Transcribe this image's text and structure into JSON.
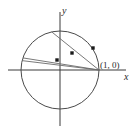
{
  "figure": {
    "background_color": "#ffffff",
    "width": 138,
    "height": 133
  },
  "labels": {
    "x_axis": "x",
    "y_axis": "y",
    "point_one_zero": "(1, 0)"
  },
  "chart_data": {
    "type": "scatter",
    "xlabel": "x",
    "ylabel": "y",
    "xlim": [
      -1.55,
      1.0
    ],
    "ylim": [
      -1.0,
      1.35
    ],
    "grid": false,
    "legend": null,
    "origin_px": [
      60,
      70
    ],
    "radius_px": 39,
    "colors": {
      "axis": "#3a3a3a",
      "circle": "#4a4a4a",
      "chord": "#6a6a6a",
      "dot": "#1a1a1a"
    },
    "circle": {
      "center": [
        0,
        0
      ],
      "radius": 1,
      "label": "unit circle"
    },
    "anchor_point": {
      "label": "(1, 0)",
      "x": 1,
      "y": 0
    },
    "chords": [
      {
        "name": "chord-1",
        "from": [
          1,
          0
        ],
        "to": [
          -0.97,
          0.24
        ],
        "midpoint": [
          0.015,
          0.12
        ]
      },
      {
        "name": "chord-2",
        "from": [
          1,
          0
        ],
        "to": [
          -0.95,
          0.31
        ],
        "midpoint": [
          0.025,
          0.155
        ]
      },
      {
        "name": "chord-3",
        "from": [
          1,
          0
        ],
        "to": [
          -0.21,
          0.975
        ],
        "midpoint": [
          0.395,
          0.49
        ]
      }
    ],
    "midpoints": [
      {
        "name": "midpoint-1",
        "x": 0.015,
        "y": 0.12,
        "px": [
          57,
          60
        ]
      },
      {
        "name": "midpoint-2",
        "x": 0.31,
        "y": 0.44,
        "px": [
          72,
          53
        ]
      },
      {
        "name": "midpoint-3",
        "x": 0.85,
        "y": 0.56,
        "px": [
          93,
          48
        ]
      }
    ],
    "axes": {
      "x_axis": {
        "from_px": [
          8,
          70
        ],
        "to_px": [
          126,
          70
        ]
      },
      "y_axis": {
        "from_px": [
          60,
          12
        ],
        "to_px": [
          60,
          126
        ]
      }
    }
  }
}
